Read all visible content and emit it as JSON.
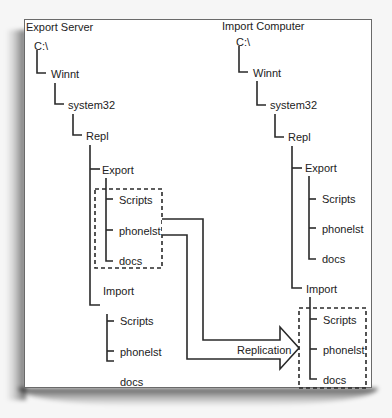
{
  "left_panel": {
    "title": "Export Server",
    "tree": {
      "root": "C:\\",
      "winnt": "Winnt",
      "system32": "system32",
      "repl": "Repl",
      "export": "Export",
      "export_children": [
        "Scripts",
        "phonelst",
        "docs"
      ],
      "import": "Import",
      "import_children": [
        "Scripts",
        "phonelst",
        "docs"
      ]
    }
  },
  "right_panel": {
    "title": "Import Computer",
    "tree": {
      "root": "C:\\",
      "winnt": "Winnt",
      "system32": "system32",
      "repl": "Repl",
      "export": "Export",
      "export_children": [
        "Scripts",
        "phonelst",
        "docs"
      ],
      "import": "Import",
      "import_children": [
        "Scripts",
        "phonelst",
        "docs"
      ]
    }
  },
  "arrow": {
    "label": "Replication"
  },
  "colors": {
    "line": "#2a2a2a",
    "frame_border": "#6a6a6a",
    "background": "#ffffff",
    "text": "#222222"
  }
}
